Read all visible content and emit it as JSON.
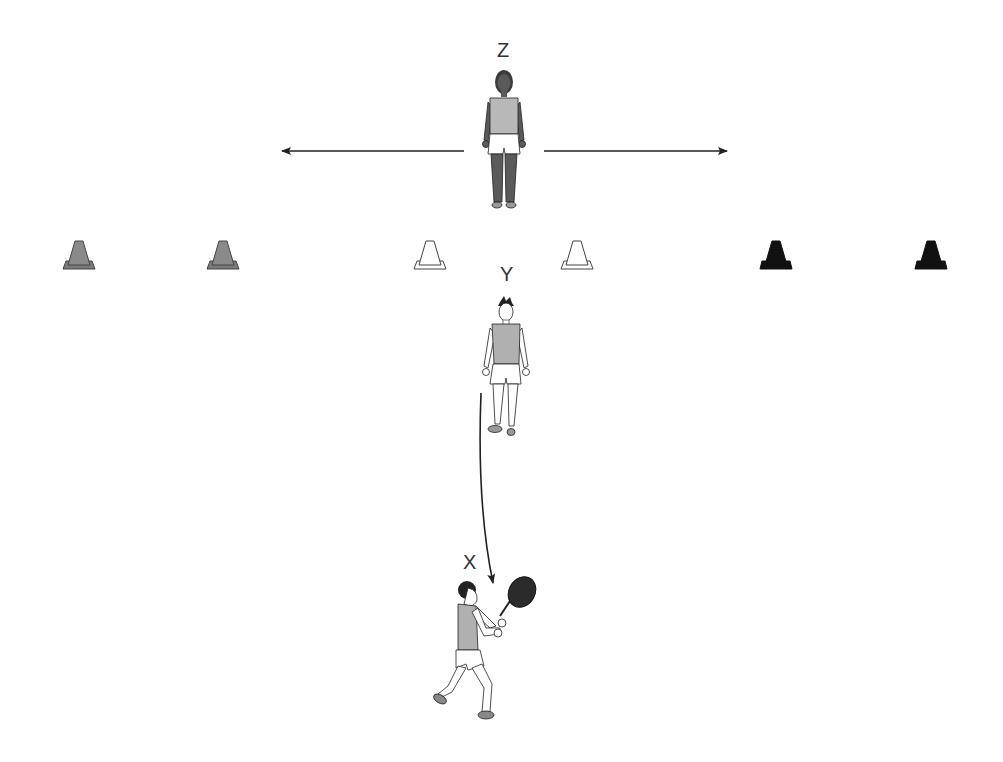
{
  "diagram": {
    "type": "tennis-drill",
    "labels": {
      "z": "Z",
      "y": "Y",
      "x": "X"
    },
    "players": [
      {
        "id": "Z",
        "role": "feeder-standing",
        "pose": "standing-front"
      },
      {
        "id": "Y",
        "role": "thrower",
        "pose": "standing-front"
      },
      {
        "id": "X",
        "role": "hitter-with-racket",
        "pose": "forehand-ready"
      }
    ],
    "cones": [
      {
        "color": "gray",
        "fill": "#8a8a8a"
      },
      {
        "color": "gray",
        "fill": "#8a8a8a"
      },
      {
        "color": "white",
        "fill": "#ffffff"
      },
      {
        "color": "white",
        "fill": "#ffffff"
      },
      {
        "color": "black",
        "fill": "#111111"
      },
      {
        "color": "black",
        "fill": "#111111"
      }
    ],
    "arrows": [
      {
        "name": "arrow-left",
        "direction": "left"
      },
      {
        "name": "arrow-right",
        "direction": "right"
      },
      {
        "name": "ball-path",
        "direction": "down-curve",
        "from": "Y",
        "to": "X"
      }
    ],
    "colors": {
      "line": "#222222",
      "shirt": "#b8b8b8",
      "skin_dark": "#5a5a5a",
      "racket": "#2b2b2b"
    }
  }
}
